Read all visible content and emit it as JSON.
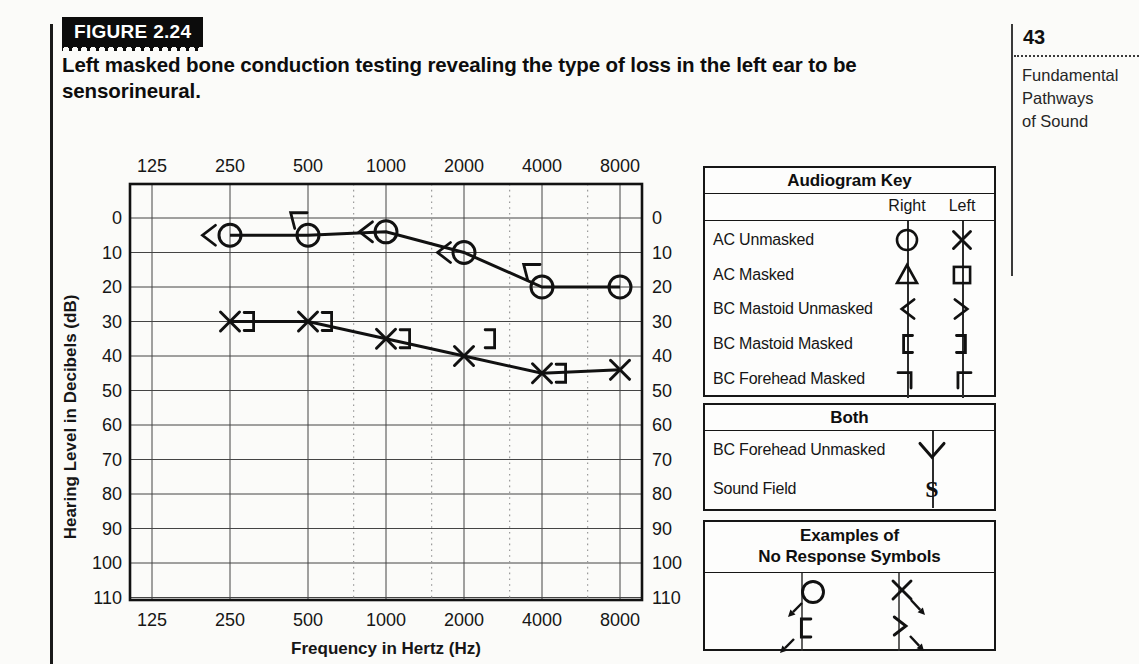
{
  "page": {
    "number": "43",
    "margin_title": "Fundamental\nPathways\nof Sound"
  },
  "figure": {
    "label": "FIGURE 2.24",
    "caption": "Left masked bone conduction testing revealing the type of loss in the left ear to be sensorineural."
  },
  "chart_data": {
    "type": "line",
    "title": "Audiogram",
    "xlabel": "Frequency in Hertz (Hz)",
    "ylabel": "Hearing Level in Decibels (dB)",
    "x_scale": "log2",
    "x_ticks": [
      125,
      250,
      500,
      1000,
      2000,
      4000,
      8000
    ],
    "y_ticks": [
      0,
      10,
      20,
      30,
      40,
      50,
      60,
      70,
      80,
      90,
      100,
      110
    ],
    "y_range": [
      -10,
      111
    ],
    "grid": {
      "horizontal": "solid",
      "octave_vertical": "solid",
      "interoctave_vertical": "dotted",
      "interoctave_freqs": [
        750,
        1500,
        3000,
        6000
      ]
    },
    "legend_position": "none",
    "series": [
      {
        "name": "Right Ear AC Unmasked",
        "symbol": "circle",
        "connected": true,
        "points": [
          {
            "f": 250,
            "db": 5
          },
          {
            "f": 500,
            "db": 5
          },
          {
            "f": 1000,
            "db": 4
          },
          {
            "f": 2000,
            "db": 10
          },
          {
            "f": 4000,
            "db": 20
          },
          {
            "f": 8000,
            "db": 20
          }
        ]
      },
      {
        "name": "Left Ear AC Unmasked",
        "symbol": "x",
        "connected": true,
        "points": [
          {
            "f": 250,
            "db": 30
          },
          {
            "f": 500,
            "db": 30
          },
          {
            "f": 1000,
            "db": 35
          },
          {
            "f": 2000,
            "db": 40
          },
          {
            "f": 4000,
            "db": 45
          },
          {
            "f": 8000,
            "db": 44
          }
        ]
      },
      {
        "name": "Right Ear BC Mastoid Unmasked",
        "symbol": "chevron-left",
        "connected": false,
        "points": [
          {
            "f": 250,
            "db": 5,
            "dx": -22
          },
          {
            "f": 500,
            "db": 0,
            "dx": -13,
            "dy": -2,
            "rot": 38
          },
          {
            "f": 1000,
            "db": 4,
            "dx": -21
          },
          {
            "f": 2000,
            "db": 10,
            "dx": -21
          },
          {
            "f": 4000,
            "db": 15,
            "dx": -14,
            "dy": -2,
            "rot": 38
          }
        ]
      },
      {
        "name": "Left Ear BC Mastoid Masked",
        "symbol": "bracket-right",
        "connected": false,
        "points": [
          {
            "f": 250,
            "db": 30,
            "dx": 20
          },
          {
            "f": 500,
            "db": 30,
            "dx": 20
          },
          {
            "f": 1000,
            "db": 35,
            "dx": 20
          },
          {
            "f": 2000,
            "db": 35,
            "dx": 27
          },
          {
            "f": 4000,
            "db": 45,
            "dx": 20
          }
        ]
      }
    ]
  },
  "key_panel": {
    "title": "Audiogram Key",
    "col_right": "Right",
    "col_left": "Left",
    "rows": [
      {
        "label": "AC Unmasked",
        "right": "circle",
        "left": "x"
      },
      {
        "label": "AC Masked",
        "right": "triangle",
        "left": "square"
      },
      {
        "label": "BC Mastoid Unmasked",
        "right": "chevron-left",
        "left": "chevron-right"
      },
      {
        "label": "BC Mastoid Masked",
        "right": "bracket-left",
        "left": "bracket-right"
      },
      {
        "label": "BC Forehead Masked",
        "right": "corner-right",
        "left": "corner-left"
      }
    ]
  },
  "both_panel": {
    "title": "Both",
    "rows": [
      {
        "label": "BC Forehead Unmasked",
        "symbol": "chevron-down"
      },
      {
        "label": "Sound Field",
        "symbol": "s"
      }
    ]
  },
  "examples_panel": {
    "title_line1": "Examples of",
    "title_line2": "No Response Symbols",
    "items": [
      {
        "symbol": "circle",
        "arrow": "sw"
      },
      {
        "symbol": "bracket-left",
        "arrow": "sw"
      },
      {
        "symbol": "x",
        "arrow": "se"
      },
      {
        "symbol": "chevron-right",
        "arrow": "se"
      }
    ]
  },
  "colors": {
    "ink": "#111111",
    "page_bg": "#fbfbf9",
    "grid": "#444444",
    "dotted_grid": "#999999"
  }
}
